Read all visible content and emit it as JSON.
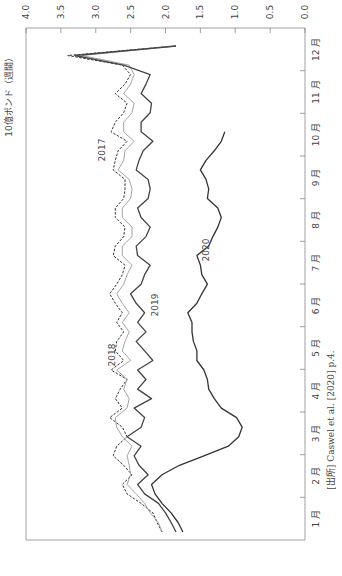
{
  "chart_data": {
    "type": "line",
    "orientation": "rotated-90-clockwise",
    "title": "",
    "ylabel": "10億ポンド（週間）",
    "xlabel": "",
    "ylim": [
      0.0,
      4.0
    ],
    "y_ticks": [
      "0.0",
      "0.5",
      "1.0",
      "1.5",
      "2.0",
      "2.5",
      "3.0",
      "3.5",
      "4.0"
    ],
    "x_tick_labels": [
      "1 月",
      "2 月",
      "3 月",
      "4 月",
      "5 月",
      "6 月",
      "7 月",
      "8 月",
      "9 月",
      "10 月",
      "11 月",
      "12 月"
    ],
    "grid": false,
    "legend": "inline labels",
    "weeks": 52,
    "series": [
      {
        "name": "2017",
        "style": "dashed",
        "color": "#333333",
        "values": [
          2.05,
          2.12,
          2.18,
          2.35,
          2.55,
          2.62,
          2.48,
          2.6,
          2.75,
          2.7,
          2.55,
          2.62,
          2.8,
          2.62,
          2.72,
          2.65,
          2.55,
          2.78,
          2.6,
          2.72,
          2.7,
          2.6,
          2.7,
          2.62,
          2.72,
          2.8,
          2.7,
          2.62,
          2.58,
          2.75,
          2.72,
          2.6,
          2.58,
          2.72,
          2.72,
          2.6,
          2.58,
          2.58,
          2.75,
          2.72,
          2.68,
          2.55,
          2.78,
          2.72,
          2.6,
          2.55,
          2.72,
          2.58,
          2.5,
          2.62,
          3.4,
          1.85
        ]
      },
      {
        "name": "2018",
        "style": "solid-thin",
        "color": "#999999",
        "values": [
          2.05,
          2.1,
          2.22,
          2.3,
          2.42,
          2.55,
          2.5,
          2.52,
          2.55,
          2.48,
          2.62,
          2.7,
          2.72,
          2.55,
          2.52,
          2.6,
          2.55,
          2.7,
          2.5,
          2.62,
          2.58,
          2.52,
          2.62,
          2.52,
          2.62,
          2.7,
          2.6,
          2.55,
          2.48,
          2.62,
          2.62,
          2.48,
          2.48,
          2.62,
          2.62,
          2.5,
          2.48,
          2.52,
          2.68,
          2.6,
          2.58,
          2.45,
          2.6,
          2.6,
          2.48,
          2.45,
          2.6,
          2.5,
          2.45,
          2.52,
          3.2,
          1.85
        ]
      },
      {
        "name": "2019",
        "style": "solid",
        "color": "#444444",
        "values": [
          1.85,
          1.92,
          2.0,
          2.1,
          2.3,
          2.4,
          2.25,
          2.38,
          2.45,
          2.35,
          2.55,
          2.35,
          2.3,
          2.45,
          2.2,
          2.4,
          2.28,
          2.4,
          2.18,
          2.3,
          2.42,
          2.28,
          2.4,
          2.3,
          2.42,
          2.5,
          2.35,
          2.3,
          2.22,
          2.4,
          2.42,
          2.28,
          2.22,
          2.35,
          2.4,
          2.25,
          2.22,
          2.25,
          2.42,
          2.38,
          2.32,
          2.18,
          2.35,
          2.35,
          2.22,
          2.2,
          2.35,
          2.28,
          2.22,
          2.6,
          3.3,
          1.85
        ]
      },
      {
        "name": "2020",
        "style": "solid",
        "color": "#333333",
        "values": [
          1.75,
          1.82,
          1.92,
          2.05,
          2.15,
          2.2,
          2.05,
          1.8,
          1.45,
          1.1,
          0.95,
          0.9,
          0.98,
          1.2,
          1.3,
          1.38,
          1.4,
          1.45,
          1.55,
          1.55,
          1.6,
          1.62,
          1.62,
          1.68,
          1.55,
          1.48,
          1.4,
          1.48,
          1.5,
          1.55,
          1.38,
          1.32,
          1.25,
          1.2,
          1.25,
          1.4,
          1.38,
          1.42,
          1.5,
          1.42,
          1.3,
          1.2,
          1.15
        ]
      }
    ],
    "annotations": [
      {
        "text": "2017",
        "near_series": "2017"
      },
      {
        "text": "2018",
        "near_series": "2018"
      },
      {
        "text": "2019",
        "near_series": "2019"
      },
      {
        "text": "2020",
        "near_series": "2020"
      }
    ],
    "source_note": "[出所] Caswel et al. [2020] p.4."
  }
}
